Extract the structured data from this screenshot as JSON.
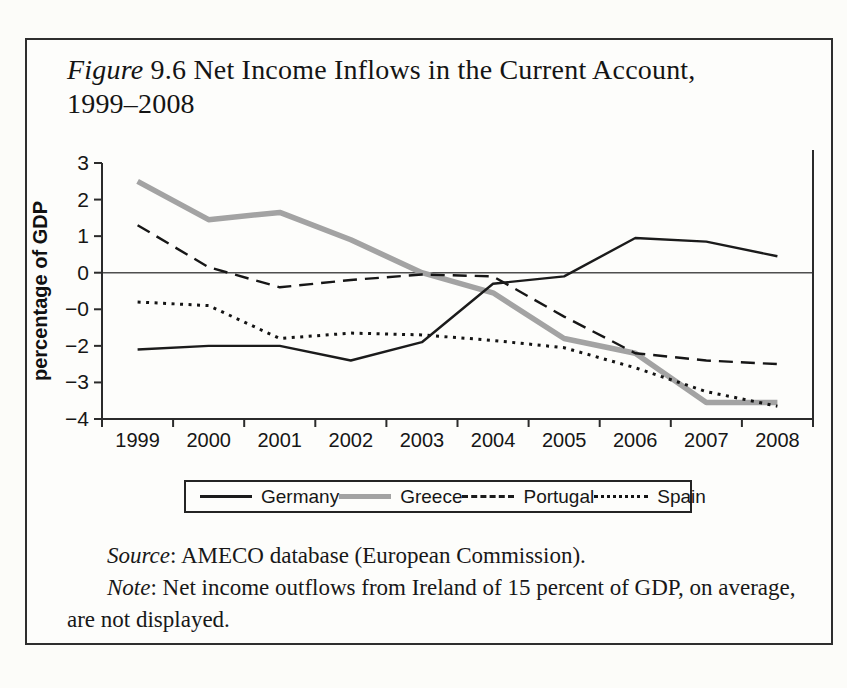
{
  "figure": {
    "title_label": "Figure",
    "title_line1": "9.6 Net Income Inflows in the Current Account,",
    "title_line2": "1999–2008"
  },
  "chart_data": {
    "type": "line",
    "title": "Figure 9.6 Net Income Inflows in the Current Account, 1999–2008",
    "xlabel": "",
    "ylabel": "percentage of GDP",
    "x": [
      1999,
      2000,
      2001,
      2002,
      2003,
      2004,
      2005,
      2006,
      2007,
      2008
    ],
    "x_tick_labels": [
      "1999",
      "2000",
      "2001",
      "2002",
      "2003",
      "2004",
      "2005",
      "2006",
      "2007",
      "2008"
    ],
    "ylim": [
      -4,
      3
    ],
    "y_ticks": [
      3,
      2,
      1,
      0,
      -1,
      -2,
      -3,
      -4
    ],
    "y_tick_labels": [
      "3",
      "2",
      "1",
      "0",
      "−0",
      "−2",
      "−3",
      "−4"
    ],
    "grid": false,
    "zero_line": true,
    "legend_position": "bottom",
    "series": [
      {
        "name": "Germany",
        "style": "solid",
        "color": "#1b1b1b",
        "width": 2.4,
        "values": [
          -2.1,
          -2.0,
          -2.0,
          -2.4,
          -1.9,
          -0.3,
          -0.1,
          0.95,
          0.85,
          0.45
        ]
      },
      {
        "name": "Greece",
        "style": "thick-solid",
        "color": "#a3a3a3",
        "width": 5.5,
        "values": [
          2.5,
          1.45,
          1.65,
          0.9,
          0.0,
          -0.55,
          -1.8,
          -2.2,
          -3.55,
          -3.55
        ]
      },
      {
        "name": "Portugal",
        "style": "dashed",
        "color": "#161616",
        "width": 2.4,
        "values": [
          1.3,
          0.15,
          -0.4,
          -0.2,
          -0.05,
          -0.1,
          -1.2,
          -2.2,
          -2.4,
          -2.5
        ]
      },
      {
        "name": "Spain",
        "style": "dotted",
        "color": "#141414",
        "width": 3.0,
        "values": [
          -0.8,
          -0.9,
          -1.8,
          -1.65,
          -1.7,
          -1.85,
          -2.05,
          -2.6,
          -3.25,
          -3.65
        ]
      }
    ]
  },
  "footer": {
    "source_label": "Source",
    "source_rest": ": AMECO database (European Commission).",
    "note_label": "Note",
    "note_rest": ": Net income outflows from Ireland of 15 percent of GDP, on average,",
    "note_cont": "are not displayed."
  }
}
